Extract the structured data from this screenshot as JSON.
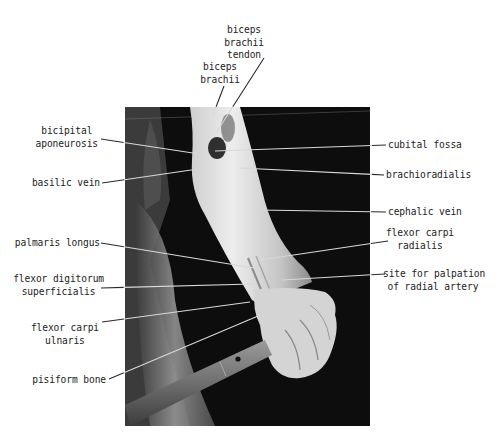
{
  "figure": {
    "photo": {
      "description": "black and white photograph of a forearm gripping a bar, anterior view",
      "x": 125,
      "y": 107,
      "width": 245,
      "height": 319,
      "background_color": "#0d0d0d",
      "skin_light": "#e8e8e8",
      "skin_mid": "#b5b5b5"
    },
    "leader_color": "#2a2a2a",
    "photo_leader_color": "#d8d8d8",
    "labels": [
      {
        "id": "biceps-brachii-tendon",
        "text": "biceps\nbrachii\ntendon",
        "x": 244,
        "y": 24,
        "align": "center",
        "line": [
          264,
          58,
          216,
          133
        ]
      },
      {
        "id": "biceps-brachii",
        "text": "biceps\nbrachii",
        "x": 220,
        "y": 61,
        "align": "center",
        "line": [
          224,
          86,
          213,
          115
        ]
      },
      {
        "id": "bicipital-aponeurosis",
        "text": "bicipital\naponeurosis",
        "x": 98,
        "y": 125,
        "align": "right",
        "line": [
          101,
          139,
          206,
          155
        ]
      },
      {
        "id": "basilic-vein",
        "text": "basilic vein",
        "x": 100,
        "y": 177,
        "align": "right",
        "line": [
          102,
          183,
          198,
          169
        ]
      },
      {
        "id": "palmaris-longus",
        "text": "palmaris longus",
        "x": 100,
        "y": 237,
        "align": "right",
        "line": [
          101,
          243,
          254,
          268
        ]
      },
      {
        "id": "flexor-digitorum-superficialis",
        "text": "flexor digitorum\nsuperficialis",
        "x": 104,
        "y": 273,
        "align": "right",
        "line": [
          101,
          288,
          253,
          284
        ]
      },
      {
        "id": "flexor-carpi-ulnaris",
        "text": "flexor carpi\nulnaris",
        "x": 99,
        "y": 322,
        "align": "right",
        "line": [
          102,
          322,
          250,
          302
        ]
      },
      {
        "id": "pisiform-bone",
        "text": "pisiform bone",
        "x": 106,
        "y": 374,
        "align": "right",
        "line": [
          109,
          379,
          258,
          316
        ]
      },
      {
        "id": "cubital-fossa",
        "text": "cubital fossa",
        "x": 388,
        "y": 139,
        "align": "left",
        "line": [
          386,
          145,
          215,
          151
        ]
      },
      {
        "id": "brachioradialis",
        "text": "brachioradialis",
        "x": 386,
        "y": 169,
        "align": "left",
        "line": [
          384,
          175,
          240,
          168
        ]
      },
      {
        "id": "cephalic-vein",
        "text": "cephalic vein",
        "x": 388,
        "y": 206,
        "align": "left",
        "line": [
          386,
          212,
          258,
          210
        ]
      },
      {
        "id": "flexor-carpi-radialis",
        "text": "flexor carpi\nradialis",
        "x": 420,
        "y": 227,
        "align": "center",
        "line": [
          388,
          241,
          260,
          260
        ]
      },
      {
        "id": "site-for-palpation",
        "text": "site for palpation\nof radial artery",
        "x": 433,
        "y": 268,
        "align": "center",
        "line": [
          385,
          274,
          282,
          280
        ]
      }
    ]
  }
}
